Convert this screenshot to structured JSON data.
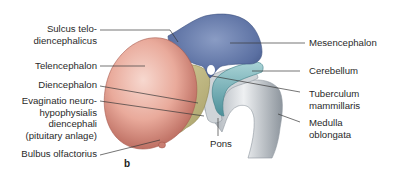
{
  "figure": {
    "panel_label": "b",
    "colors": {
      "telencephalon": "#e8a89a",
      "diencephalon": "#c9c08a",
      "mesencephalon": "#5e74a6",
      "cerebellum": "#5fa3ad",
      "brainstem": "#c6cbd0",
      "leader_line": "#333333"
    },
    "labels_left": [
      {
        "id": "sulcus",
        "text": "Sulcus telo-\ndiencephalicus"
      },
      {
        "id": "telencephalon",
        "text": "Telencephalon"
      },
      {
        "id": "diencephalon",
        "text": "Diencephalon"
      },
      {
        "id": "evaginatio",
        "text": "Evaginatio neuro-\nhypophysialis\ndiencephali\n(pituitary anlage)"
      },
      {
        "id": "bulbus",
        "text": "Bulbus olfactorius"
      }
    ],
    "labels_right": [
      {
        "id": "mesencephalon",
        "text": "Mesencephalon"
      },
      {
        "id": "cerebellum",
        "text": "Cerebellum"
      },
      {
        "id": "tuberculum",
        "text": "Tuberculum\nmammillaris"
      },
      {
        "id": "medulla",
        "text": "Medulla\noblongata"
      }
    ],
    "labels_bottom": [
      {
        "id": "pons",
        "text": "Pons"
      }
    ]
  }
}
